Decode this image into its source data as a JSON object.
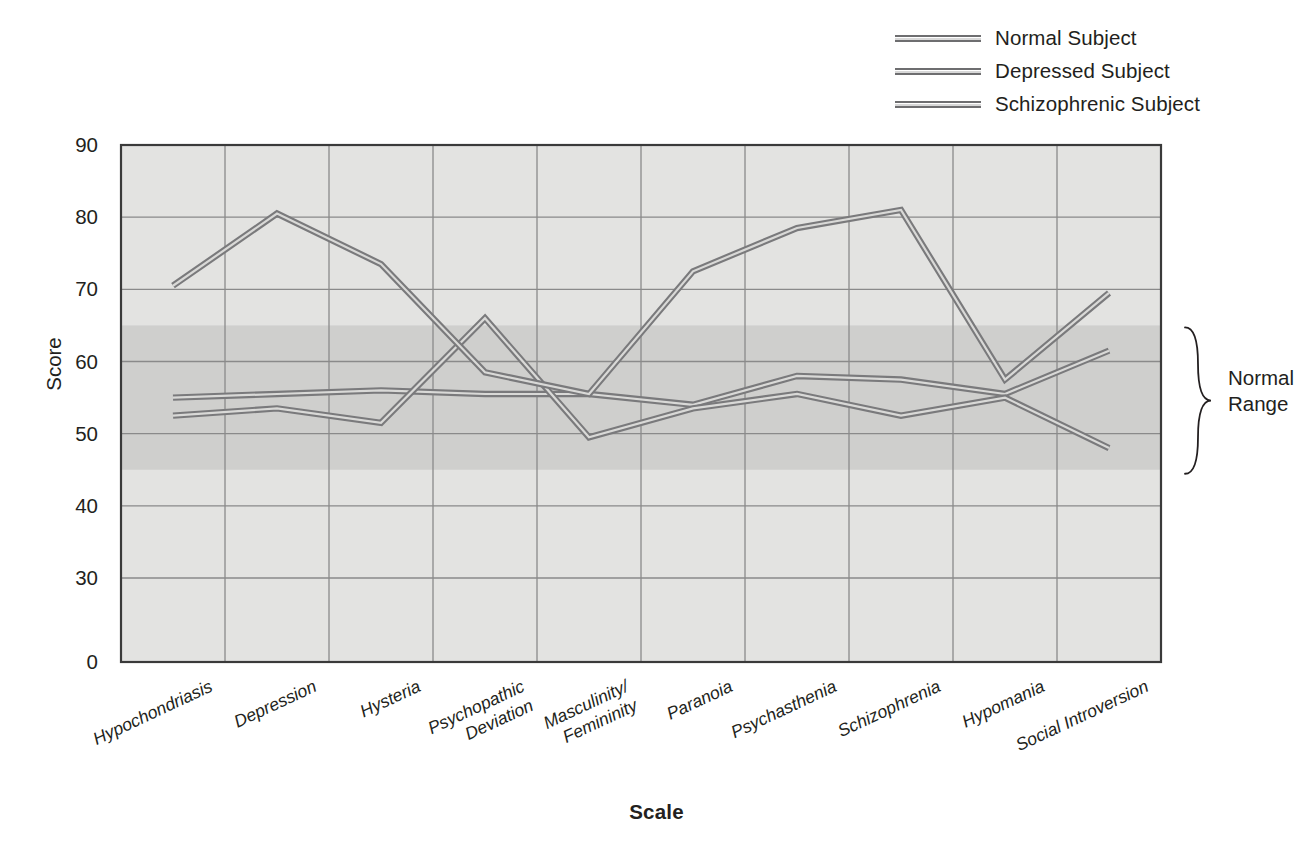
{
  "chart_data": {
    "type": "line",
    "title": "",
    "xlabel": "Scale",
    "ylabel": "Score",
    "ylim": [
      0,
      90
    ],
    "yticks": [
      0,
      30,
      40,
      50,
      60,
      70,
      80,
      90
    ],
    "grid": true,
    "legend_position": "top-right",
    "categories": [
      "Hypochondriasis",
      "Depression",
      "Hysteria",
      "Psychopathic\nDeviation",
      "Masculinity/\nFemininity",
      "Paranoia",
      "Psychasthenia",
      "Schizophrenia",
      "Hypomania",
      "Social Introversion"
    ],
    "series": [
      {
        "name": "Normal Subject",
        "color": "#7a7a7c",
        "values": [
          55,
          55.5,
          56,
          55.5,
          55.5,
          54,
          58,
          57.5,
          55.5,
          61.5
        ]
      },
      {
        "name": "Depressed Subject",
        "color": "#7a7a7c",
        "values": [
          52.5,
          53.5,
          51.5,
          66,
          49.5,
          53.5,
          55.5,
          52.5,
          55,
          48
        ]
      },
      {
        "name": "Schizophrenic Subject",
        "color": "#7a7a7c",
        "values": [
          70.5,
          80.5,
          73.5,
          58.5,
          55.5,
          72.5,
          78.5,
          81,
          57.5,
          69.5
        ]
      }
    ],
    "annotations": [
      {
        "name": "normal-range",
        "label": "Normal\nRange",
        "band_min": 45,
        "band_max": 65
      }
    ]
  },
  "legend": {
    "items": [
      {
        "label": "Normal Subject"
      },
      {
        "label": "Depressed Subject"
      },
      {
        "label": "Schizophrenic Subject"
      }
    ]
  },
  "axes": {
    "y_title": "Score",
    "x_title": "Scale",
    "y_ticks": [
      "90",
      "80",
      "70",
      "60",
      "50",
      "40",
      "30",
      "0"
    ]
  },
  "annotation": {
    "normal_range": "Normal\nRange"
  },
  "colors": {
    "line": "#7a7a7c",
    "plot_bg": "#e3e3e1",
    "band": "#cfcfcd",
    "grid": "#8a8a8a",
    "text": "#231f20"
  }
}
